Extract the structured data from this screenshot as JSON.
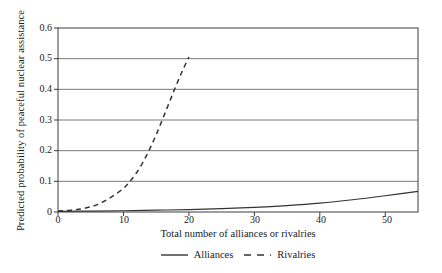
{
  "chart_data": {
    "type": "line",
    "title": "",
    "xlabel": "Total number of alliances or rivalries",
    "ylabel": "Predicted probability of peaceful nuclear assistance",
    "xlim": [
      0,
      55
    ],
    "ylim": [
      0,
      0.6
    ],
    "xticks": [
      "0",
      "10",
      "20",
      "30",
      "40",
      "50"
    ],
    "xtick_values": [
      0,
      10,
      20,
      30,
      40,
      50
    ],
    "yticks": [
      "0",
      "0.1",
      "0.2",
      "0.3",
      "0.4",
      "0.5",
      "0.6"
    ],
    "ytick_values": [
      0,
      0.1,
      0.2,
      0.3,
      0.4,
      0.5,
      0.6
    ],
    "grid": "horizontal",
    "legend_position": "below-axis-label",
    "series": [
      {
        "name": "Alliances",
        "style": "solid",
        "color": "#333333",
        "x": [
          0,
          5,
          10,
          15,
          20,
          25,
          30,
          35,
          40,
          45,
          50,
          55
        ],
        "values": [
          0.002,
          0.003,
          0.004,
          0.006,
          0.008,
          0.011,
          0.015,
          0.021,
          0.029,
          0.04,
          0.053,
          0.067
        ]
      },
      {
        "name": "Rivalries",
        "style": "dashed",
        "color": "#333333",
        "x": [
          0,
          2,
          4,
          6,
          8,
          10,
          11,
          12,
          13,
          14,
          15,
          16,
          17,
          18,
          19,
          20
        ],
        "values": [
          0.003,
          0.006,
          0.012,
          0.024,
          0.047,
          0.077,
          0.1,
          0.128,
          0.163,
          0.205,
          0.252,
          0.304,
          0.357,
          0.41,
          0.46,
          0.505
        ]
      }
    ]
  },
  "legend": {
    "entries": [
      {
        "label": "Alliances"
      },
      {
        "label": "Rivalries"
      }
    ]
  },
  "colors": {
    "axis": "#3d3d3d",
    "grid": "#6b6b6b",
    "series": "#333333",
    "background": "#ffffff"
  }
}
